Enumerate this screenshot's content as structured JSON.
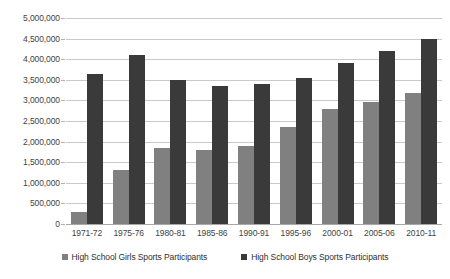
{
  "chart_data": {
    "type": "bar",
    "title": "",
    "subtitle": "",
    "xlabel": "",
    "ylabel": "",
    "grid": true,
    "legend_position": "bottom",
    "ylim": [
      0,
      5000000
    ],
    "ytick_step": 500000,
    "ytick_labels": [
      "5,000,000",
      "4,500,000",
      "4,000,000",
      "3,500,000",
      "3,000,000",
      "2,500,000",
      "2,000,000",
      "1,500,000",
      "1,000,000",
      "500,000",
      "0"
    ],
    "ytick_values": [
      5000000,
      4500000,
      4000000,
      3500000,
      3000000,
      2500000,
      2000000,
      1500000,
      1000000,
      500000,
      0
    ],
    "categories": [
      "1971-72",
      "1975-76",
      "1980-81",
      "1985-86",
      "1990-91",
      "1995-96",
      "2000-01",
      "2005-06",
      "2010-11"
    ],
    "series": [
      {
        "name": "High School Girls Sports Participants",
        "color": "#808080",
        "values": [
          300000,
          1300000,
          1850000,
          1800000,
          1900000,
          2350000,
          2790000,
          2950000,
          3170000
        ]
      },
      {
        "name": "High School Boys Sports Participants",
        "color": "#3a3a3a",
        "values": [
          3650000,
          4100000,
          3500000,
          3350000,
          3400000,
          3550000,
          3900000,
          4200000,
          4490000
        ]
      }
    ]
  },
  "colors": {
    "girls": "#808080",
    "boys": "#3a3a3a",
    "gridline": "#c9c9c9",
    "baseline": "#a8a8a8",
    "text": "#3f3f3f",
    "background": "#ffffff"
  }
}
